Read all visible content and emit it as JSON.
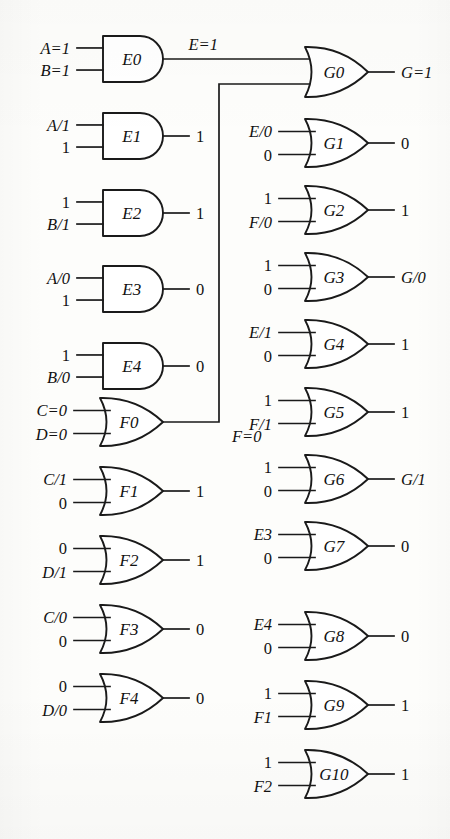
{
  "diagram": {
    "background_color": "#fdfdfb",
    "line_color": "#1a1a1a",
    "signal_wire_labels": {
      "e_trunk": "E=1",
      "f_trunk": "F=0"
    }
  },
  "gates": [
    {
      "id": "E0",
      "name": "E0",
      "type": "and",
      "inputs": [
        "A=1",
        "B=1"
      ],
      "output": "E=1",
      "output_label_position": "above-wire",
      "x": 103,
      "y": 36,
      "w": 60,
      "h": 46
    },
    {
      "id": "E1",
      "name": "E1",
      "type": "and",
      "inputs": [
        "A/1",
        "1"
      ],
      "output": "1",
      "x": 103,
      "y": 113,
      "w": 60,
      "h": 46
    },
    {
      "id": "E2",
      "name": "E2",
      "type": "and",
      "inputs": [
        "1",
        "B/1"
      ],
      "output": "1",
      "x": 103,
      "y": 190,
      "w": 60,
      "h": 46
    },
    {
      "id": "E3",
      "name": "E3",
      "type": "and",
      "inputs": [
        "A/0",
        "1"
      ],
      "output": "0",
      "x": 103,
      "y": 266,
      "w": 60,
      "h": 46
    },
    {
      "id": "E4",
      "name": "E4",
      "type": "and",
      "inputs": [
        "1",
        "B/0"
      ],
      "output": "0",
      "x": 103,
      "y": 343,
      "w": 60,
      "h": 46
    },
    {
      "id": "F0",
      "name": "F0",
      "type": "or",
      "inputs": [
        "C=0",
        "D=0"
      ],
      "output": "F=0",
      "output_label_position": "below-wire",
      "x": 100,
      "y": 398,
      "w": 63,
      "h": 48
    },
    {
      "id": "F1",
      "name": "F1",
      "type": "or",
      "inputs": [
        "C/1",
        "0"
      ],
      "output": "1",
      "x": 100,
      "y": 467,
      "w": 63,
      "h": 48
    },
    {
      "id": "F2",
      "name": "F2",
      "type": "or",
      "inputs": [
        "0",
        "D/1"
      ],
      "output": "1",
      "x": 100,
      "y": 536,
      "w": 63,
      "h": 48
    },
    {
      "id": "F3",
      "name": "F3",
      "type": "or",
      "inputs": [
        "C/0",
        "0"
      ],
      "output": "0",
      "x": 100,
      "y": 605,
      "w": 63,
      "h": 48
    },
    {
      "id": "F4",
      "name": "F4",
      "type": "or",
      "inputs": [
        "0",
        "D/0"
      ],
      "output": "0",
      "x": 100,
      "y": 674,
      "w": 63,
      "h": 48
    },
    {
      "id": "G0",
      "name": "G0",
      "type": "or",
      "inputs": [
        "E=1",
        "F=0"
      ],
      "inputs_from_wires": true,
      "output": "G=1",
      "x": 305,
      "y": 47,
      "w": 63,
      "h": 50
    },
    {
      "id": "G1",
      "name": "G1",
      "type": "or",
      "inputs": [
        "E/0",
        "0"
      ],
      "output": "0",
      "x": 305,
      "y": 119,
      "w": 63,
      "h": 48
    },
    {
      "id": "G2",
      "name": "G2",
      "type": "or",
      "inputs": [
        "1",
        "F/0"
      ],
      "output": "1",
      "x": 305,
      "y": 186,
      "w": 63,
      "h": 48
    },
    {
      "id": "G3",
      "name": "G3",
      "type": "or",
      "inputs": [
        "1",
        "0"
      ],
      "output": "G/0",
      "x": 305,
      "y": 253,
      "w": 63,
      "h": 48
    },
    {
      "id": "G4",
      "name": "G4",
      "type": "or",
      "inputs": [
        "E/1",
        "0"
      ],
      "output": "1",
      "x": 305,
      "y": 320,
      "w": 63,
      "h": 48
    },
    {
      "id": "G5",
      "name": "G5",
      "type": "or",
      "inputs": [
        "1",
        "F/1"
      ],
      "output": "1",
      "x": 305,
      "y": 388,
      "w": 63,
      "h": 48
    },
    {
      "id": "G6",
      "name": "G6",
      "type": "or",
      "inputs": [
        "1",
        "0"
      ],
      "output": "G/1",
      "x": 305,
      "y": 455,
      "w": 63,
      "h": 48
    },
    {
      "id": "G7",
      "name": "G7",
      "type": "or",
      "inputs": [
        "E3",
        "0"
      ],
      "output": "0",
      "x": 305,
      "y": 522,
      "w": 63,
      "h": 48
    },
    {
      "id": "G8",
      "name": "G8",
      "type": "or",
      "inputs": [
        "E4",
        "0"
      ],
      "output": "0",
      "x": 305,
      "y": 612,
      "w": 63,
      "h": 48
    },
    {
      "id": "G9",
      "name": "G9",
      "type": "or",
      "inputs": [
        "1",
        "F1"
      ],
      "output": "1",
      "x": 305,
      "y": 681,
      "w": 63,
      "h": 48
    },
    {
      "id": "G10",
      "name": "G10",
      "type": "or",
      "inputs": [
        "1",
        "F2"
      ],
      "output": "1",
      "x": 305,
      "y": 750,
      "w": 63,
      "h": 48
    }
  ]
}
